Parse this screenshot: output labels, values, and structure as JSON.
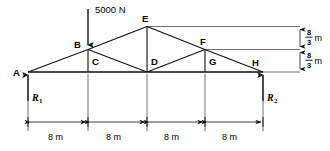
{
  "diagram": {
    "type": "statics-truss-free-body-diagram",
    "load": {
      "label": "5000 N",
      "applied_at_node": "B",
      "direction": "down"
    },
    "reactions": [
      {
        "label": "R",
        "subscript": "1",
        "at_node": "A",
        "direction": "up"
      },
      {
        "label": "R",
        "subscript": "2",
        "at_node": "H",
        "direction": "up"
      }
    ],
    "nodes": [
      {
        "id": "A",
        "label": "A"
      },
      {
        "id": "B",
        "label": "B"
      },
      {
        "id": "C",
        "label": "C"
      },
      {
        "id": "D",
        "label": "D"
      },
      {
        "id": "E",
        "label": "E"
      },
      {
        "id": "F",
        "label": "F"
      },
      {
        "id": "G",
        "label": "G"
      },
      {
        "id": "H",
        "label": "H"
      }
    ],
    "horizontal_dimensions": [
      {
        "label": "8 m"
      },
      {
        "label": "8 m"
      },
      {
        "label": "8 m"
      },
      {
        "label": "8 m"
      }
    ],
    "vertical_dimensions": [
      {
        "numerator": "8",
        "denominator": "3",
        "unit": "m"
      },
      {
        "numerator": "8",
        "denominator": "3",
        "unit": "m"
      }
    ],
    "colors": {
      "line": "#111111",
      "extension_line": "#333333",
      "background": "#ffffff"
    }
  }
}
